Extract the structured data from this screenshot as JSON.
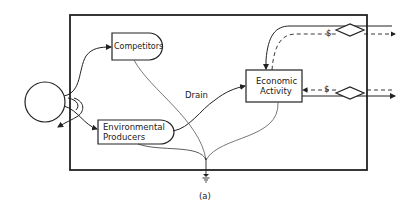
{
  "diagram": {
    "type": "energy-systems-diagram",
    "caption": "(a)",
    "nodes": [
      {
        "id": "source",
        "shape": "circle",
        "label": ""
      },
      {
        "id": "competitors",
        "shape": "tank",
        "label": "Competitors"
      },
      {
        "id": "env_producers",
        "shape": "tank",
        "label_line1": "Environmental",
        "label_line2": "Producers"
      },
      {
        "id": "economic_activity",
        "shape": "box",
        "label_line1": "Economic",
        "label_line2": "Activity"
      },
      {
        "id": "exchange_top",
        "shape": "diamond",
        "label": ""
      },
      {
        "id": "exchange_bottom",
        "shape": "diamond",
        "label": ""
      },
      {
        "id": "heat_sink",
        "shape": "ground",
        "label": ""
      }
    ],
    "edge_labels": {
      "drain": "Drain",
      "money_top": "$",
      "money_bottom": "$"
    },
    "colors": {
      "line": "#222222",
      "background": "#ffffff"
    }
  }
}
